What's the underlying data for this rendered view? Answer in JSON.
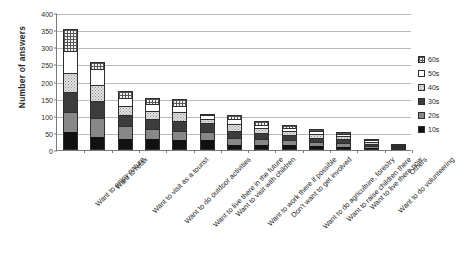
{
  "chart_data": {
    "type": "bar",
    "title": "",
    "subtitle": "",
    "xlabel": "",
    "ylabel": "Number of answers",
    "ylim": [
      0,
      400
    ],
    "yticks": [
      0,
      50,
      100,
      150,
      200,
      250,
      300,
      350,
      400
    ],
    "ytick_labels": [
      "0",
      "50",
      "100",
      "150",
      "200",
      "250",
      "300",
      "350",
      "400"
    ],
    "grid": true,
    "stacked": true,
    "legend_position": "right",
    "legend": [
      "60s",
      "50s",
      "40s",
      "30s",
      "20s",
      "10s"
    ],
    "categories": [
      "Want to enjoy nature",
      "Want to relax",
      "Want to visit as a tourist",
      "Want to do outdoor activities",
      "Want to live there in the future",
      "Want to visit with children",
      "Want to work there if possible",
      "Don't want to get involved",
      "Want to do agriculture, forestry",
      "Want to raise children there",
      "Want to live there now",
      "Want to do volunteering",
      "Others"
    ],
    "series": [
      {
        "name": "10s",
        "values": [
          52,
          37,
          31,
          33,
          30,
          28,
          14,
          16,
          14,
          11,
          10,
          7,
          4
        ]
      },
      {
        "name": "20s",
        "values": [
          58,
          56,
          40,
          29,
          25,
          24,
          21,
          17,
          14,
          12,
          10,
          6,
          2
        ]
      },
      {
        "name": "30s",
        "values": [
          60,
          50,
          32,
          28,
          30,
          26,
          22,
          17,
          15,
          13,
          11,
          6,
          2
        ]
      },
      {
        "name": "40s",
        "values": [
          55,
          47,
          25,
          24,
          25,
          14,
          19,
          13,
          12,
          12,
          10,
          5,
          1
        ]
      },
      {
        "name": "50s",
        "values": [
          63,
          48,
          23,
          21,
          20,
          9,
          14,
          11,
          10,
          9,
          6,
          5,
          1
        ]
      },
      {
        "name": "60s",
        "values": [
          65,
          20,
          20,
          18,
          18,
          4,
          12,
          10,
          9,
          5,
          5,
          3,
          1
        ]
      }
    ],
    "totals": [
      353,
      258,
      171,
      153,
      148,
      105,
      102,
      84,
      74,
      62,
      52,
      32,
      11
    ]
  },
  "legend_items": [
    {
      "label": "60s",
      "key": "s60"
    },
    {
      "label": "50s",
      "key": "s50"
    },
    {
      "label": "40s",
      "key": "s40"
    },
    {
      "label": "30s",
      "key": "s30"
    },
    {
      "label": "20s",
      "key": "s20"
    },
    {
      "label": "10s",
      "key": "s10"
    }
  ]
}
